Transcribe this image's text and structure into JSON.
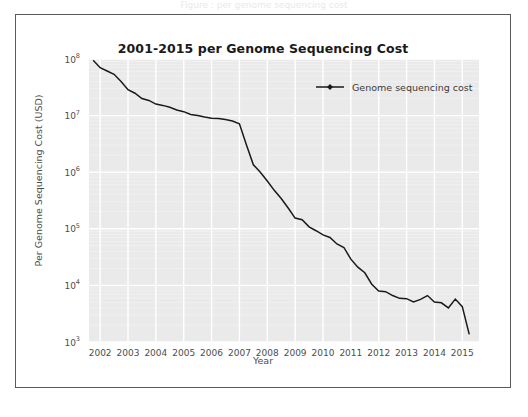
{
  "caption_fragment": "Figure : per genome sequencing cost",
  "card": {
    "title": "2001-2015 per Genome Sequencing Cost"
  },
  "axes": {
    "xlabel": "Year",
    "ylabel": "Per Genome Sequencing Cost (USD)",
    "xticks": [
      "2002",
      "2003",
      "2004",
      "2005",
      "2006",
      "2007",
      "2008",
      "2009",
      "2010",
      "2011",
      "2012",
      "2013",
      "2014",
      "2015"
    ],
    "yticks": [
      {
        "label": "10",
        "exp": "8",
        "value": 100000000
      },
      {
        "label": "10",
        "exp": "7",
        "value": 10000000
      },
      {
        "label": "10",
        "exp": "6",
        "value": 1000000
      },
      {
        "label": "10",
        "exp": "5",
        "value": 100000
      },
      {
        "label": "10",
        "exp": "4",
        "value": 10000
      },
      {
        "label": "10",
        "exp": "3",
        "value": 1000
      }
    ]
  },
  "legend": {
    "label": "Genome sequencing cost",
    "position": "top-right"
  },
  "style": {
    "plot_bg": "#eaeaea",
    "grid_color": "#ffffff",
    "line_color": "#1a1a1a",
    "marker_color": "#1a1a1a",
    "frame_color": "#5a5a5a",
    "text_color": "#4d4d4d"
  },
  "chart_data": {
    "type": "line",
    "title": "2001-2015 per Genome Sequencing Cost",
    "xlabel": "Year",
    "ylabel": "Per Genome Sequencing Cost (USD)",
    "yscale": "log",
    "ylim": [
      1000,
      100000000
    ],
    "xlim": [
      2001.6,
      2015.6
    ],
    "grid": true,
    "legend": "Genome sequencing cost",
    "series": [
      {
        "name": "Genome sequencing cost",
        "x": [
          2001.75,
          2002.0,
          2002.25,
          2002.5,
          2002.75,
          2003.0,
          2003.25,
          2003.5,
          2003.75,
          2004.0,
          2004.25,
          2004.5,
          2004.75,
          2005.0,
          2005.25,
          2005.5,
          2005.75,
          2006.0,
          2006.25,
          2006.5,
          2006.75,
          2007.0,
          2007.25,
          2007.5,
          2007.75,
          2008.0,
          2008.25,
          2008.5,
          2008.75,
          2009.0,
          2009.25,
          2009.5,
          2009.75,
          2010.0,
          2010.25,
          2010.5,
          2010.75,
          2011.0,
          2011.25,
          2011.5,
          2011.75,
          2012.0,
          2012.25,
          2012.5,
          2012.75,
          2013.0,
          2013.25,
          2013.5,
          2013.75,
          2014.0,
          2014.25,
          2014.5,
          2014.75,
          2015.0,
          2015.25
        ],
        "values": [
          95263072,
          70175437,
          61448422,
          53751684,
          40157554,
          28780376,
          24858400,
          20000000,
          18519312,
          16000000,
          15140000,
          14000000,
          12600000,
          11732535,
          10474556,
          10000000,
          9408739,
          9000000,
          8927342,
          8500000,
          8000000,
          7147571,
          3063820,
          1352982,
          1000000,
          700000,
          478000,
          342502,
          232735,
          154714,
          144640,
          108065,
          92500,
          78000,
          70333,
          54000,
          46774,
          29092,
          20963,
          16712,
          10497,
          7950,
          7743,
          6618,
          5901,
          5826,
          5096,
          5671,
          6618,
          5096,
          4920,
          4008,
          5731,
          4211,
          1363
        ]
      }
    ]
  }
}
